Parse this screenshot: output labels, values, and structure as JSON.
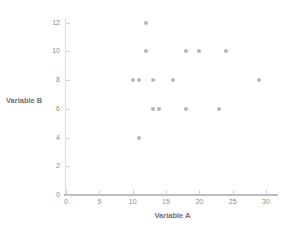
{
  "chart_data": {
    "type": "scatter",
    "title": "",
    "xlabel": "Variable A",
    "ylabel": "Variable B",
    "xlim": [
      0,
      31
    ],
    "ylim": [
      0,
      13
    ],
    "xticks": [
      0,
      5,
      10,
      15,
      20,
      25,
      30
    ],
    "yticks": [
      0,
      2,
      4,
      6,
      8,
      10,
      12
    ],
    "xtick_labels": [
      "0",
      "5",
      "10",
      "15",
      "20",
      "25",
      "30"
    ],
    "ytick_labels": [
      "0",
      "2",
      "4",
      "6",
      "8",
      "10",
      "12"
    ],
    "grid": false,
    "legend": null,
    "marker_color": "#b7b7b7",
    "axis_color": "#bdbdbd",
    "points": [
      {
        "x": 10,
        "y": 8
      },
      {
        "x": 11,
        "y": 8
      },
      {
        "x": 11,
        "y": 4
      },
      {
        "x": 12,
        "y": 12
      },
      {
        "x": 12,
        "y": 10
      },
      {
        "x": 13,
        "y": 8
      },
      {
        "x": 13,
        "y": 6
      },
      {
        "x": 14,
        "y": 6
      },
      {
        "x": 16,
        "y": 8
      },
      {
        "x": 18,
        "y": 10
      },
      {
        "x": 18,
        "y": 6
      },
      {
        "x": 20,
        "y": 10
      },
      {
        "x": 23,
        "y": 6
      },
      {
        "x": 24,
        "y": 10
      },
      {
        "x": 29,
        "y": 8
      }
    ]
  }
}
